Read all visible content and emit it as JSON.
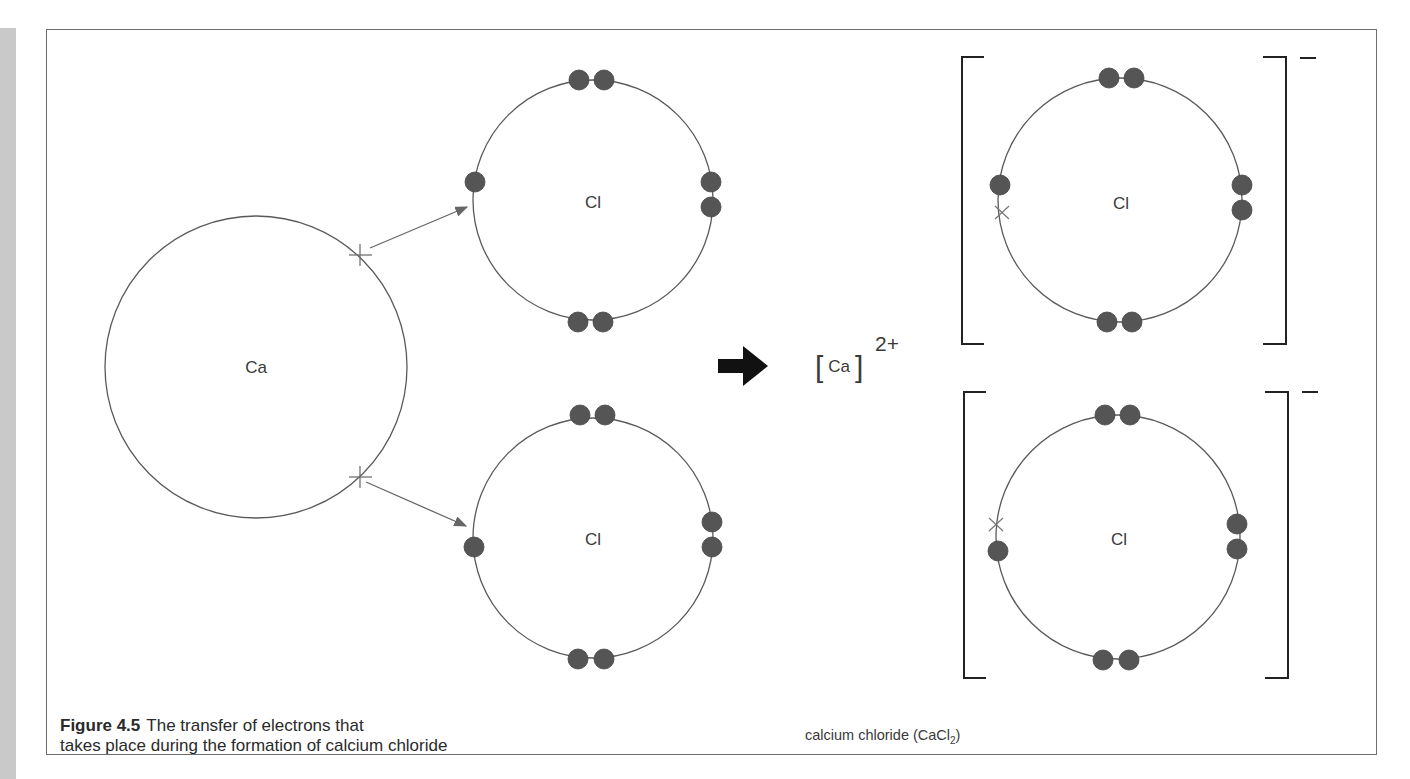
{
  "figure": {
    "number": "Figure 4.5",
    "caption_line1": "The transfer of electrons that",
    "caption_line2": "takes place during the formation of calcium chloride"
  },
  "atoms": {
    "calcium": {
      "label": "Ca",
      "outer_electrons_transferred": 2
    },
    "chlorine_top": {
      "label": "Cl",
      "outer_electrons": 7
    },
    "chlorine_bottom": {
      "label": "Cl",
      "outer_electrons": 7
    }
  },
  "product": {
    "calcium_ion": {
      "label": "Ca",
      "charge": "2+"
    },
    "chloride_ion_top": {
      "label": "Cl",
      "charge": "−",
      "outer_electrons": 8
    },
    "chloride_ion_bottom": {
      "label": "Cl",
      "charge": "−",
      "outer_electrons": 8
    },
    "name": "calcium chloride (CaCl",
    "formula_subscript": "2",
    "name_close": ")"
  },
  "icons": {
    "reaction_arrow": "right-arrow",
    "transfer_arrows": "thin-arrow",
    "ca_electron_marker": "cross",
    "transferred_electron_marker": "x"
  },
  "colors": {
    "electron_dot": "#555555",
    "orbit_line": "#5a5a5a",
    "bracket": "#222222",
    "box_border": "#6e6e6e",
    "side_strip": "#c9c9c9"
  }
}
